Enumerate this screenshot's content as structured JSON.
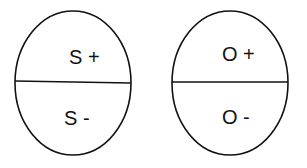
{
  "diagram": {
    "ellipses": [
      {
        "id": "S",
        "top_label": "S +",
        "bottom_label": "S -"
      },
      {
        "id": "O",
        "top_label": "O +",
        "bottom_label": "O -"
      }
    ]
  }
}
